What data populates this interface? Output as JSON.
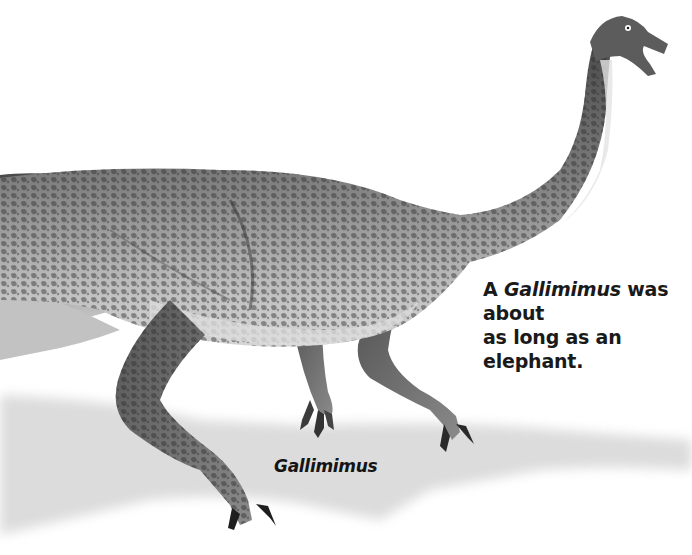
{
  "caption": {
    "prefix": "A ",
    "species_italic": "Gallimimus",
    "line1_rest": " was about",
    "line2": "as long as an elephant."
  },
  "label": {
    "name": "Gallimimus"
  },
  "illustration": {
    "subject": "Gallimimus dinosaur running, side view",
    "palette": {
      "background": "#ffffff",
      "skin_dark": "#3a3a3a",
      "skin_mid": "#7a7a7a",
      "skin_light": "#c8c8c8",
      "shadow": "#d9d9d9"
    }
  }
}
